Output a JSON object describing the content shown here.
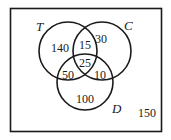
{
  "diagram": {
    "type": "venn",
    "sets": [
      {
        "label": "T",
        "only": "140"
      },
      {
        "label": "C",
        "only": "30"
      },
      {
        "label": "D",
        "only": "100"
      }
    ],
    "regions": {
      "T_and_C_only": "15",
      "T_and_D_only": "50",
      "C_and_D_only": "10",
      "T_and_C_and_D": "25",
      "outside": "150"
    }
  }
}
